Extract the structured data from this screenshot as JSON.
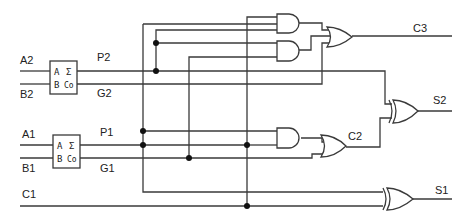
{
  "diagram": {
    "inputs": {
      "a2": "A2",
      "b2": "B2",
      "a1": "A1",
      "b1": "B1",
      "c1": "C1"
    },
    "signals": {
      "p2": "P2",
      "g2": "G2",
      "p1": "P1",
      "g1": "G1"
    },
    "outputs": {
      "c3": "C3",
      "s2": "S2",
      "c2": "C2",
      "s1": "S1"
    },
    "half_adder": {
      "a": "A",
      "b": "B",
      "sum": "Σ",
      "carry": "Co"
    },
    "gates": [
      {
        "id": "and-c3-top",
        "type": "AND",
        "inputs": 3
      },
      {
        "id": "and-c3-bottom",
        "type": "AND",
        "inputs": 2
      },
      {
        "id": "or-c3",
        "type": "OR",
        "inputs": 3
      },
      {
        "id": "xor-s2",
        "type": "XOR",
        "inputs": 2
      },
      {
        "id": "and-c2",
        "type": "AND",
        "inputs": 2
      },
      {
        "id": "or-c2",
        "type": "OR",
        "inputs": 2
      },
      {
        "id": "xor-s1",
        "type": "XOR",
        "inputs": 2
      }
    ]
  }
}
